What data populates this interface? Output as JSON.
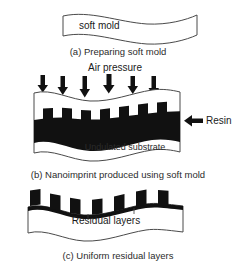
{
  "figure": {
    "title_visible": false,
    "background_color": "#ffffff",
    "ink_color": "#111111",
    "outline_color": "#4a4a4a"
  },
  "panel_a": {
    "caption": "(a) Preparing soft mold",
    "mold_label": "soft mold"
  },
  "panel_b": {
    "caption": "(b) Nanoimprint produced using soft mold",
    "air_pressure_label": "Air pressure",
    "resin_label": "Resin",
    "substrate_label": "Undulated substrate",
    "arrow_count": 6,
    "resin_feature_count": 6
  },
  "panel_c": {
    "caption": "(c) Uniform residual layers",
    "residual_label": "Residual layers",
    "feature_count": 6
  }
}
